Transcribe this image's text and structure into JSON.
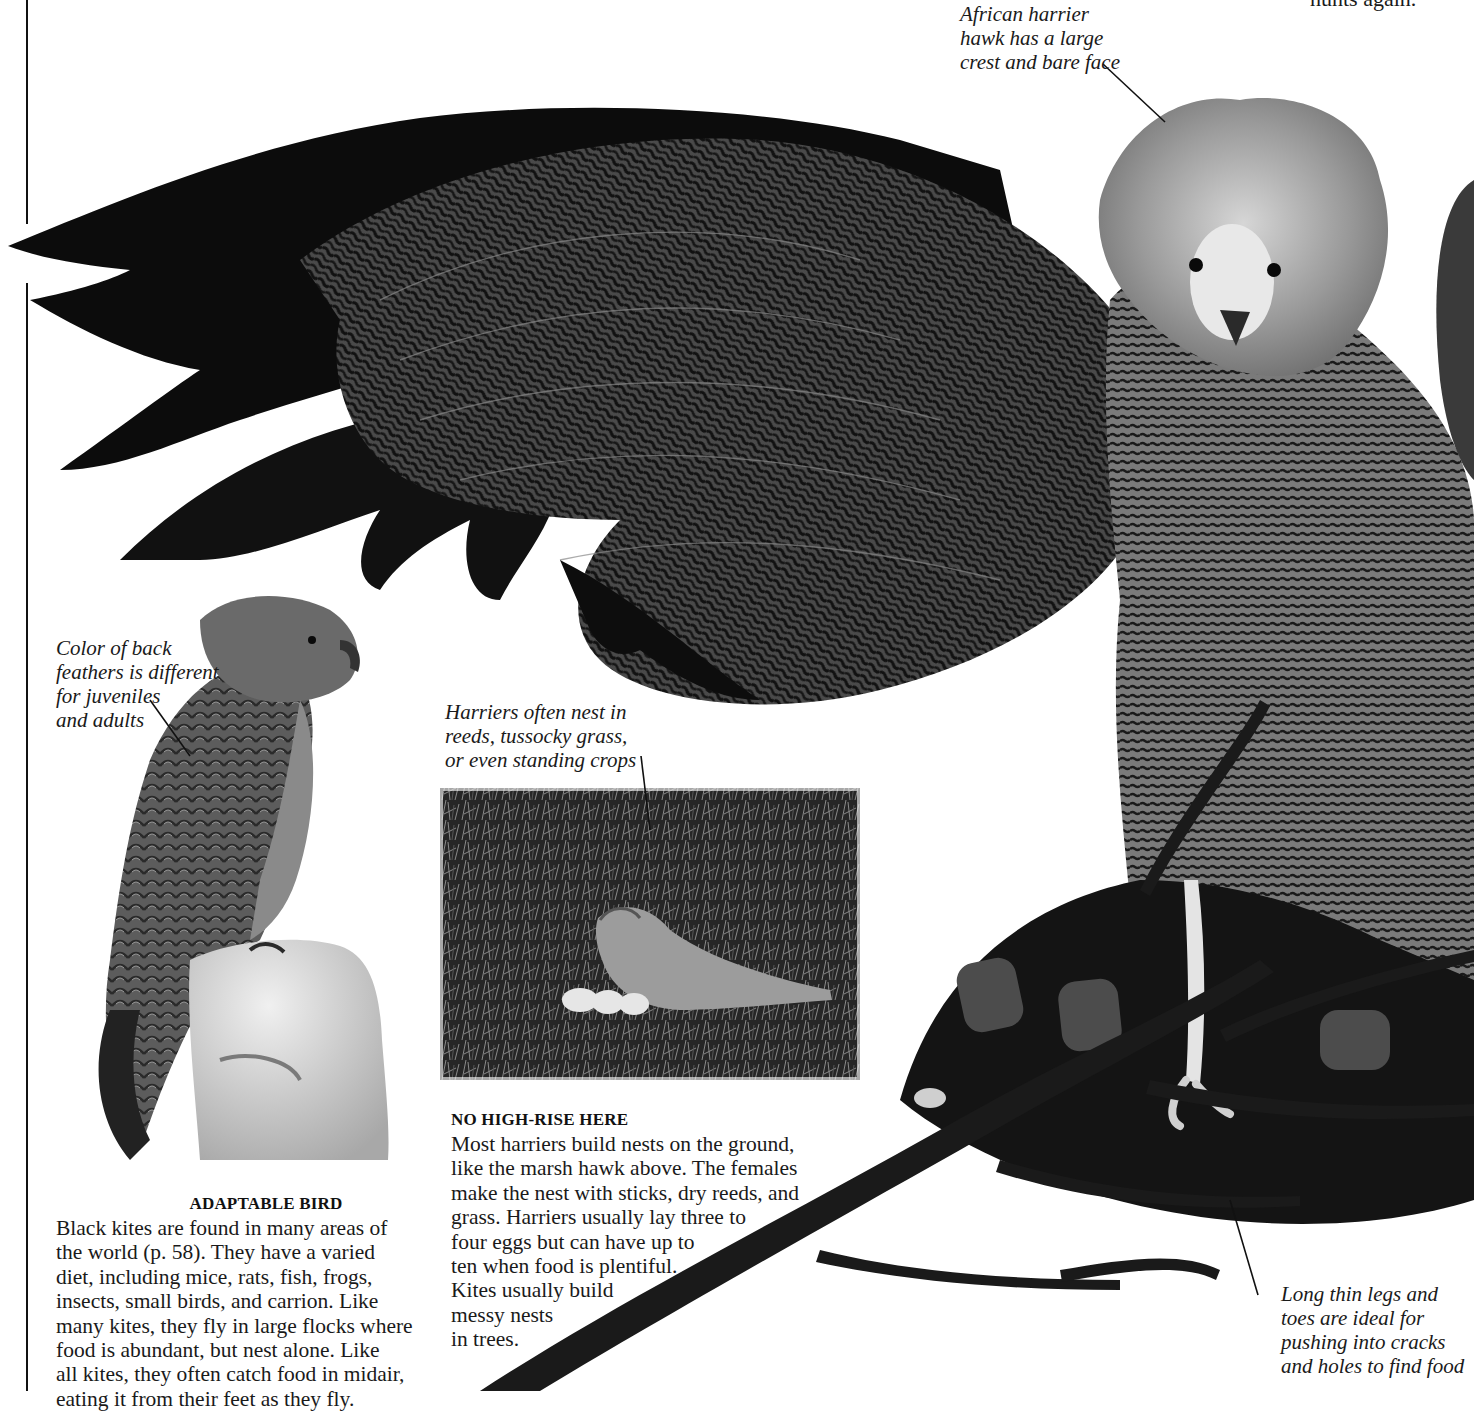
{
  "page": {
    "top_right_fragment": "hunts again."
  },
  "captions": {
    "african_harrier": "African harrier\nhawk has a large\ncrest and bare face",
    "back_feathers": "Color of back\nfeathers is different\nfor juveniles\nand adults",
    "harrier_nest": "Harriers often nest in\nreeds, tussocky grass,\nor even standing crops",
    "long_legs": "Long thin legs and\ntoes are ideal for\npushing into cracks\nand holes to find food"
  },
  "sections": {
    "adaptable_bird": {
      "heading": "ADAPTABLE BIRD",
      "lines": [
        "Black kites are found in many areas of",
        "the world (p. 58). They have a varied",
        "diet, including mice, rats, fish, frogs,",
        "insects, small birds, and carrion. Like",
        "many kites, they fly in large flocks where",
        "food is abundant, but nest alone. Like",
        "all kites, they often catch food in midair,",
        "eating it from their feet as they fly."
      ]
    },
    "no_high_rise": {
      "heading": "NO HIGH-RISE HERE",
      "lines": [
        "Most harriers build nests on the ground,",
        "like the marsh hawk above. The females",
        "make the nest with sticks, dry reeds, and",
        "grass. Harriers usually lay three to",
        "four eggs but can have up to",
        "ten when food is plentiful.",
        "Kites usually build",
        "messy nests",
        "in trees."
      ]
    }
  },
  "images": {
    "african_harrier_hawk": "African harrier hawk with outstretched wing perched on branch",
    "black_kite": "Black kite perched on stone post",
    "marsh_hawk_nest": "Marsh hawk at ground nest with chicks"
  }
}
